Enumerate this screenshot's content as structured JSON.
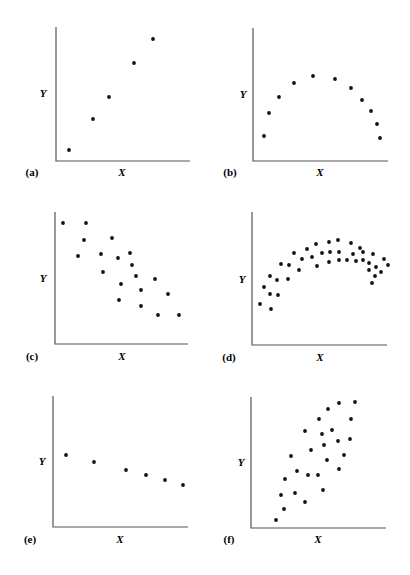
{
  "figure": {
    "background": "#ffffff",
    "axis_color": "#555555",
    "point_color": "#111111"
  },
  "chart_data": [
    {
      "id": "a",
      "type": "scatter",
      "panel_label": "(a)",
      "xlabel": "X",
      "ylabel": "Y",
      "description": "strong positive linear relationship",
      "axes": {
        "x0": 56,
        "y0": 161,
        "x1": 190,
        "ytop": 27
      },
      "label_pos": {
        "panel": [
          32,
          176
        ],
        "x": [
          122,
          176
        ],
        "y": [
          43,
          97
        ]
      },
      "points": [
        [
          69,
          150
        ],
        [
          93,
          119
        ],
        [
          109,
          97
        ],
        [
          134,
          63
        ],
        [
          153,
          39
        ]
      ]
    },
    {
      "id": "b",
      "type": "scatter",
      "panel_label": "(b)",
      "xlabel": "X",
      "ylabel": "Y",
      "description": "curvilinear (inverted U) relationship",
      "axes": {
        "x0": 253,
        "y0": 161,
        "x1": 388,
        "ytop": 28
      },
      "label_pos": {
        "panel": [
          230,
          176
        ],
        "x": [
          320,
          176
        ],
        "y": [
          243,
          98
        ]
      },
      "points": [
        [
          264,
          136
        ],
        [
          269,
          113
        ],
        [
          279,
          97
        ],
        [
          294,
          83
        ],
        [
          313,
          76
        ],
        [
          335,
          79
        ],
        [
          351,
          88
        ],
        [
          362,
          100
        ],
        [
          371,
          111
        ],
        [
          377,
          124
        ],
        [
          380,
          138
        ]
      ]
    },
    {
      "id": "c",
      "type": "scatter",
      "panel_label": "(c)",
      "xlabel": "X",
      "ylabel": "Y",
      "description": "negative linear relationship with scatter",
      "axes": {
        "x0": 55,
        "y0": 344,
        "x1": 188,
        "ytop": 212
      },
      "label_pos": {
        "panel": [
          32,
          360
        ],
        "x": [
          122,
          360
        ],
        "y": [
          43,
          282
        ]
      },
      "points": [
        [
          63,
          223
        ],
        [
          86,
          223
        ],
        [
          84,
          240
        ],
        [
          112,
          238
        ],
        [
          78,
          256
        ],
        [
          101,
          254
        ],
        [
          118,
          258
        ],
        [
          130,
          253
        ],
        [
          132,
          265
        ],
        [
          103,
          272
        ],
        [
          136,
          276
        ],
        [
          155,
          279
        ],
        [
          121,
          284
        ],
        [
          141,
          290
        ],
        [
          168,
          294
        ],
        [
          119,
          300
        ],
        [
          141,
          306
        ],
        [
          158,
          315
        ],
        [
          179,
          315
        ]
      ]
    },
    {
      "id": "d",
      "type": "scatter",
      "panel_label": "(d)",
      "xlabel": "X",
      "ylabel": "Y",
      "description": "curvilinear relationship with scatter",
      "axes": {
        "x0": 252,
        "y0": 345,
        "x1": 387,
        "ytop": 212
      },
      "label_pos": {
        "panel": [
          229,
          361
        ],
        "x": [
          320,
          361
        ],
        "y": [
          242,
          283
        ]
      },
      "points": [
        [
          260,
          304
        ],
        [
          264,
          287
        ],
        [
          270,
          294
        ],
        [
          270,
          276
        ],
        [
          271,
          309
        ],
        [
          277,
          280
        ],
        [
          278,
          295
        ],
        [
          281,
          264
        ],
        [
          288,
          279
        ],
        [
          289,
          265
        ],
        [
          294,
          253
        ],
        [
          299,
          270
        ],
        [
          302,
          259
        ],
        [
          307,
          249
        ],
        [
          312,
          257
        ],
        [
          316,
          244
        ],
        [
          317,
          266
        ],
        [
          322,
          253
        ],
        [
          329,
          242
        ],
        [
          329,
          262
        ],
        [
          330,
          252
        ],
        [
          338,
          240
        ],
        [
          339,
          252
        ],
        [
          339,
          260
        ],
        [
          347,
          260
        ],
        [
          351,
          243
        ],
        [
          353,
          254
        ],
        [
          356,
          261
        ],
        [
          360,
          248
        ],
        [
          363,
          252
        ],
        [
          363,
          260
        ],
        [
          369,
          263
        ],
        [
          369,
          270
        ],
        [
          373,
          254
        ],
        [
          372,
          283
        ],
        [
          375,
          276
        ],
        [
          376,
          267
        ],
        [
          381,
          272
        ],
        [
          384,
          259
        ],
        [
          388,
          265
        ]
      ]
    },
    {
      "id": "e",
      "type": "scatter",
      "panel_label": "(e)",
      "xlabel": "X",
      "ylabel": "Y",
      "description": "weak negative linear relationship",
      "axes": {
        "x0": 53,
        "y0": 527,
        "x1": 188,
        "ytop": 396
      },
      "label_pos": {
        "panel": [
          30,
          543
        ],
        "x": [
          120,
          543
        ],
        "y": [
          42,
          465
        ]
      },
      "points": [
        [
          66,
          455
        ],
        [
          94,
          462
        ],
        [
          126,
          470
        ],
        [
          146,
          475
        ],
        [
          165,
          480
        ],
        [
          183,
          485
        ]
      ]
    },
    {
      "id": "f",
      "type": "scatter",
      "panel_label": "(f)",
      "xlabel": "X",
      "ylabel": "Y",
      "description": "positive linear relationship with scatter",
      "axes": {
        "x0": 251,
        "y0": 528,
        "x1": 386,
        "ytop": 397
      },
      "label_pos": {
        "panel": [
          229,
          543
        ],
        "x": [
          318,
          543
        ],
        "y": [
          241,
          466
        ]
      },
      "points": [
        [
          276,
          520
        ],
        [
          284,
          509
        ],
        [
          281,
          495
        ],
        [
          285,
          479
        ],
        [
          295,
          493
        ],
        [
          291,
          456
        ],
        [
          297,
          471
        ],
        [
          305,
          502
        ],
        [
          305,
          431
        ],
        [
          308,
          475
        ],
        [
          311,
          450
        ],
        [
          318,
          475
        ],
        [
          319,
          419
        ],
        [
          322,
          434
        ],
        [
          323,
          490
        ],
        [
          324,
          445
        ],
        [
          327,
          460
        ],
        [
          328,
          409
        ],
        [
          332,
          430
        ],
        [
          338,
          441
        ],
        [
          339,
          469
        ],
        [
          339,
          403
        ],
        [
          344,
          455
        ],
        [
          350,
          439
        ],
        [
          351,
          419
        ],
        [
          355,
          402
        ]
      ]
    }
  ]
}
